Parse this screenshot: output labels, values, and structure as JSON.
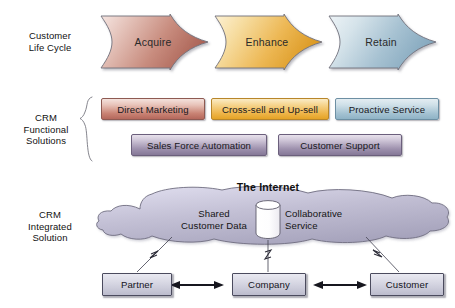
{
  "diagram": {
    "background": "#ffffff"
  },
  "rows": [
    {
      "id": "life-cycle",
      "label_line1": "Customer",
      "label_line2": "Life Cycle",
      "label_line3": ""
    },
    {
      "id": "functional",
      "label_line1": "CRM",
      "label_line2": "Functional",
      "label_line3": "Solutions"
    },
    {
      "id": "integrated",
      "label_line1": "CRM",
      "label_line2": "Integrated",
      "label_line3": "Solution"
    }
  ],
  "life_cycle": {
    "stages": [
      {
        "label": "Acquire",
        "fill_light": "#f3ded9",
        "fill_dark": "#b5685c",
        "stroke": "#6d6d78"
      },
      {
        "label": "Enhance",
        "fill_light": "#fbeecb",
        "fill_dark": "#e0a033",
        "stroke": "#6d6d78"
      },
      {
        "label": "Retain",
        "fill_light": "#e7eff3",
        "fill_dark": "#7fa5bb",
        "stroke": "#6d6d78"
      }
    ]
  },
  "functional_solutions": {
    "row1": [
      {
        "label": "Direct Marketing",
        "color": "rose"
      },
      {
        "label": "Cross-sell and Up-sell",
        "color": "gold"
      },
      {
        "label": "Proactive Service",
        "color": "blue"
      }
    ],
    "row2": [
      {
        "label": "Sales Force Automation",
        "color": "purple"
      },
      {
        "label": "Customer Support",
        "color": "purple"
      }
    ]
  },
  "integrated_solution": {
    "internet_title": "The Internet",
    "cloud": {
      "fill_light": "#d7d5e4",
      "fill_dark": "#a9a6bd",
      "stroke": "#6f6d80",
      "left_text_line1": "Shared",
      "left_text_line2": "Customer Data",
      "right_text_line1": "Collaborative",
      "right_text_line2": "Service",
      "database_icon": "database-cylinder"
    },
    "nodes": [
      {
        "label": "Partner"
      },
      {
        "label": "Company"
      },
      {
        "label": "Customer"
      }
    ],
    "connectors": [
      {
        "from": "cloud",
        "to": "Partner",
        "style": "lightning-line"
      },
      {
        "from": "cloud",
        "to": "Company",
        "style": "lightning-line"
      },
      {
        "from": "cloud",
        "to": "Customer",
        "style": "lightning-line"
      }
    ],
    "peer_links": [
      {
        "from": "Partner",
        "to": "Company",
        "style": "double-arrow"
      },
      {
        "from": "Company",
        "to": "Customer",
        "style": "double-arrow"
      }
    ]
  }
}
